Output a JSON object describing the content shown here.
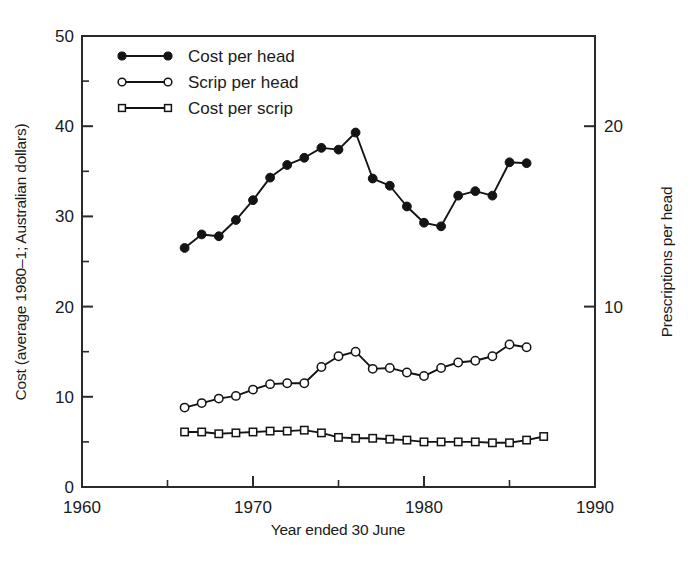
{
  "chart_data": {
    "type": "line",
    "title": "",
    "xlabel": "Year ended 30 June",
    "ylabel": "Cost (average 1980–1; Australian dollars)",
    "ylabel_right": "Prescriptions per head",
    "xlim": [
      1960,
      1990
    ],
    "ylim": [
      0,
      50
    ],
    "ylim_right": [
      0,
      25
    ],
    "grid": false,
    "legend_position": "top-left",
    "x_ticks_major": [
      1960,
      1970,
      1980,
      1990
    ],
    "x_ticks_major_labels": [
      "1960",
      "1970",
      "1980",
      "1990"
    ],
    "x_ticks_minor": [
      1965,
      1975,
      1985
    ],
    "y_ticks_major": [
      0,
      10,
      20,
      30,
      40,
      50
    ],
    "y_ticks_major_labels": [
      "0",
      "10",
      "20",
      "30",
      "40",
      "50"
    ],
    "y_ticks_minor": [
      5,
      15,
      25,
      35,
      45
    ],
    "y_right_ticks_major": [
      10,
      20
    ],
    "y_right_ticks_major_labels": [
      "10",
      "20"
    ],
    "series": [
      {
        "name": "Cost per head",
        "marker": "filled-circle",
        "axis": "left",
        "x": [
          1966,
          1967,
          1968,
          1969,
          1970,
          1971,
          1972,
          1973,
          1974,
          1975,
          1976,
          1977,
          1978,
          1979,
          1980,
          1981,
          1982,
          1983,
          1984,
          1985,
          1986
        ],
        "values": [
          26.5,
          28.0,
          27.8,
          29.6,
          31.8,
          34.3,
          35.7,
          36.5,
          37.6,
          37.4,
          39.3,
          34.2,
          33.4,
          31.1,
          29.3,
          28.9,
          32.3,
          32.8,
          32.3,
          36.0,
          35.9
        ]
      },
      {
        "name": "Scrip per head",
        "marker": "open-circle",
        "axis": "left",
        "x": [
          1966,
          1967,
          1968,
          1969,
          1970,
          1971,
          1972,
          1973,
          1974,
          1975,
          1976,
          1977,
          1978,
          1979,
          1980,
          1981,
          1982,
          1983,
          1984,
          1985,
          1986
        ],
        "values": [
          8.8,
          9.3,
          9.8,
          10.1,
          10.8,
          11.4,
          11.5,
          11.5,
          13.3,
          14.5,
          15.0,
          13.1,
          13.2,
          12.7,
          12.3,
          13.2,
          13.8,
          14.0,
          14.5,
          15.8,
          15.5
        ]
      },
      {
        "name": "Cost per scrip",
        "marker": "open-square",
        "axis": "left",
        "x": [
          1966,
          1967,
          1968,
          1969,
          1970,
          1971,
          1972,
          1973,
          1974,
          1975,
          1976,
          1977,
          1978,
          1979,
          1980,
          1981,
          1982,
          1983,
          1984,
          1985,
          1986,
          1987
        ],
        "values": [
          6.1,
          6.1,
          5.9,
          6.0,
          6.1,
          6.2,
          6.2,
          6.3,
          6.0,
          5.5,
          5.4,
          5.4,
          5.3,
          5.2,
          5.0,
          5.0,
          5.0,
          5.0,
          4.9,
          4.9,
          5.2,
          5.6
        ]
      }
    ]
  },
  "legend": {
    "items": [
      {
        "label": "Cost per head",
        "marker": "filled-circle"
      },
      {
        "label": "Scrip per head",
        "marker": "open-circle"
      },
      {
        "label": "Cost per scrip",
        "marker": "open-square"
      }
    ]
  },
  "colors": {
    "ink": "#1a1a1a",
    "axis": "#2a2a2a",
    "marker_fill_open": "#ffffff"
  }
}
